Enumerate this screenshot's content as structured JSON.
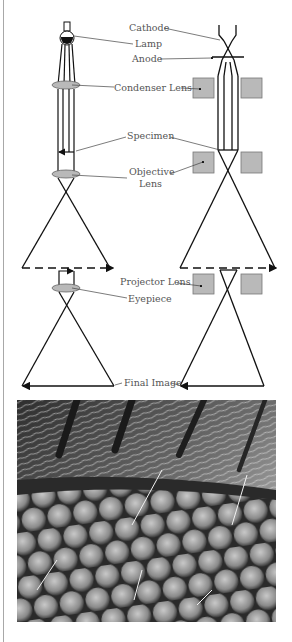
{
  "diagram": {
    "colors": {
      "line": "#111111",
      "lens_fill": "#b9b9b9",
      "lens_stroke": "#666666",
      "label": "#555555",
      "frame": "#a8a8a8"
    },
    "labels": {
      "cathode": "Cathode",
      "lamp": "Lamp",
      "anode": "Anode",
      "condenser_lens": "Condenser Lens",
      "specimen": "Specimen",
      "objective_lens_line1": "Objective",
      "objective_lens_line2": "Lens",
      "projector_lens": "Projector Lens",
      "eyepiece": "Eyepiece",
      "final_image": "Final Image"
    },
    "left_column": "light-microscope",
    "right_column": "electron-microscope"
  },
  "photo": {
    "description": "Scanning electron micrograph of insect compound eye with bristles and hairs",
    "icon": "sem-micrograph-image"
  }
}
